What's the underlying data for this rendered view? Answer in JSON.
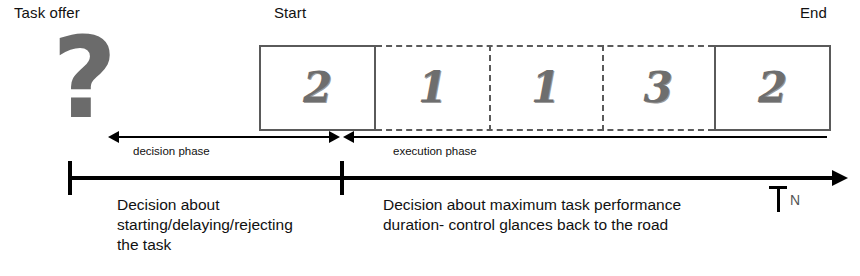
{
  "diagram": {
    "title_labels": {
      "task_offer": "Task offer",
      "start": "Start",
      "end": "End"
    },
    "question_icon": "?",
    "axis": {
      "end_tick_label": "N"
    },
    "boxes": [
      {
        "value": "2",
        "style": "solid",
        "left": 0,
        "width": 117
      },
      {
        "value": "1",
        "style": "dashed",
        "left": 117,
        "width": 113
      },
      {
        "value": "1",
        "style": "dashed",
        "left": 230,
        "width": 113
      },
      {
        "value": "3",
        "style": "dashed",
        "left": 343,
        "width": 112
      },
      {
        "value": "2",
        "style": "solid",
        "left": 455,
        "width": 117
      }
    ],
    "separators": [
      {
        "left": 230
      },
      {
        "left": 343
      }
    ],
    "phases": [
      {
        "id": "decision",
        "arrow_label": "decision phase",
        "caption": "Decision about\nstarting/delaying/rejecting\nthe task"
      },
      {
        "id": "execution",
        "arrow_label": "execution phase",
        "caption": "Decision about maximum task performance\nduration- control glances back to the road"
      }
    ],
    "colors": {
      "box_border": "#5a5a5a",
      "numeral": "#6e6e6e",
      "question_mark": "#6b6b6b",
      "axis": "#000000",
      "text": "#111111"
    }
  }
}
